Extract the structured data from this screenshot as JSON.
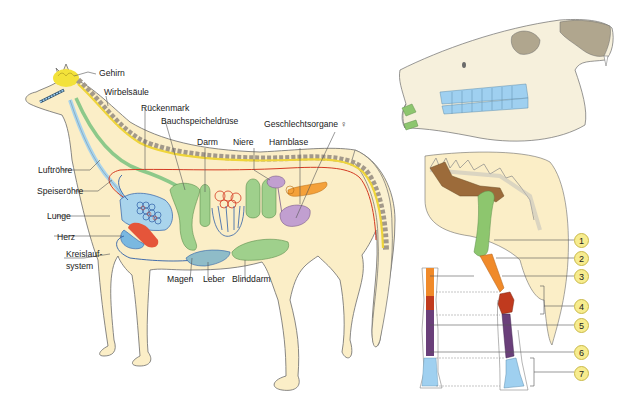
{
  "horse_labels": {
    "gehirn": "Gehirn",
    "wirbelsaeule": "Wirbelsäule",
    "rueckenmark": "Rückenmark",
    "bauchspeicheldruese": "Bauchspeicheldrüse",
    "darm": "Darm",
    "niere": "Niere",
    "harnblase": "Harnblase",
    "geschlechtsorgane": "Geschlechtsorgane ♀",
    "luftroehre": "Luftröhre",
    "speiseroehre": "Speiseröhre",
    "lunge": "Lunge",
    "herz": "Herz",
    "kreislauf_1": "Kreislauf-",
    "kreislauf_2": "system",
    "magen": "Magen",
    "leber": "Leber",
    "blinddarm": "Blinddarm"
  },
  "leg_numbers": [
    "1",
    "2",
    "3",
    "4",
    "5",
    "6",
    "7"
  ],
  "colors": {
    "body": "#fbeec7",
    "outline": "#6b6b6b",
    "brain": "#f3e23a",
    "spine_segments": "#a3998a",
    "spinal_cord": "#efd53a",
    "trachea": "#a9d4ec",
    "esophagus": "#8dc98a",
    "lung": "#a9d4ec",
    "heart": "#e5553a",
    "vessels_blue": "#2e5fa8",
    "vessels_red": "#d43a22",
    "gut": "#9fd08c",
    "kidney_bladder": "#c19fd0",
    "ovary": "#f4a13a",
    "teeth": "#9fd0f0",
    "skull": "#f6f0dc",
    "skull_dark": "#b0a68e",
    "scapula": "#9c6b3a",
    "humerus": "#8dc66e",
    "radius": "#f08a2a",
    "carpus": "#c03a1e",
    "cannon": "#6a3f7a",
    "hoof_bones": "#9fd0f0",
    "number_badge": "#f7ec8e"
  }
}
